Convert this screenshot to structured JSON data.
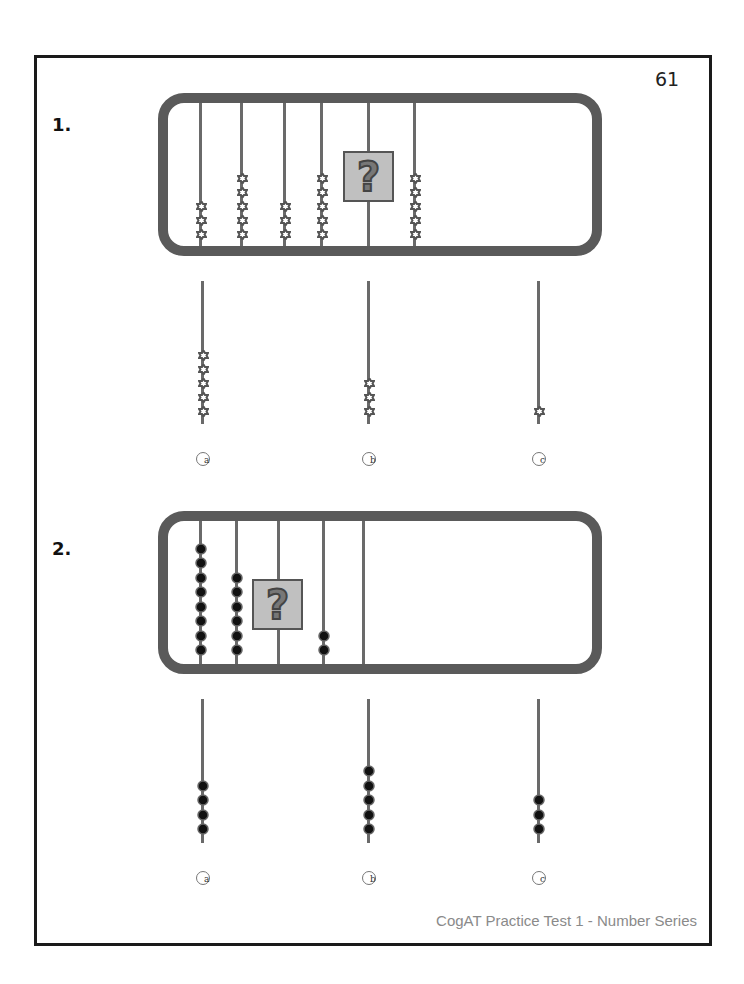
{
  "page": {
    "number": "61",
    "footer": "CogAT Practice Test 1 - Number Series"
  },
  "colors": {
    "frame": "#5a5a5a",
    "rod": "#6a6a6a",
    "question_box": "#c0c0c0",
    "border": "#1a1a1a",
    "footer_text": "#8a8a8a"
  },
  "questions": [
    {
      "label": "1.",
      "bead_style": "star",
      "frame_rods": [
        {
          "beads": 3
        },
        {
          "beads": 5
        },
        {
          "beads": 3
        },
        {
          "beads": 5
        },
        {
          "beads": null,
          "question": true
        },
        {
          "beads": 5
        }
      ],
      "question_mark": "?",
      "choices": [
        {
          "letter": "a",
          "beads": 5
        },
        {
          "letter": "b",
          "beads": 3
        },
        {
          "letter": "c",
          "beads": 1
        }
      ]
    },
    {
      "label": "2.",
      "bead_style": "dot",
      "frame_rods": [
        {
          "beads": 8
        },
        {
          "beads": 6
        },
        {
          "beads": null,
          "question": true
        },
        {
          "beads": 2
        },
        {
          "beads": 0
        }
      ],
      "question_mark": "?",
      "choices": [
        {
          "letter": "a",
          "beads": 4
        },
        {
          "letter": "b",
          "beads": 5
        },
        {
          "letter": "c",
          "beads": 3
        }
      ]
    }
  ]
}
